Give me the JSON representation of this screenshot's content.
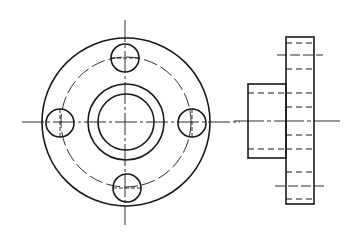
{
  "drawing": {
    "title": "Flange – front view and side view",
    "stroke_color": "#1a1a1a",
    "background_color": "#ffffff",
    "front_view": {
      "center": [
        125,
        122
      ],
      "outer_circle_radius": 84,
      "bolt_circle_radius": 63,
      "hub_outer_radius": 38,
      "bore_radius": 28,
      "bolt_hole_radius": 14,
      "bolt_holes": [
        {
          "name": "top",
          "cx": 125,
          "cy": 58
        },
        {
          "name": "right",
          "cx": 189,
          "cy": 122
        },
        {
          "name": "bottom",
          "cx": 127,
          "cy": 187
        },
        {
          "name": "left",
          "cx": 60,
          "cy": 122
        }
      ]
    },
    "side_view": {
      "flange_rect": {
        "x": 286,
        "y": 37,
        "w": 28,
        "h": 167
      },
      "hub_rect": {
        "x": 248,
        "y": 84,
        "w": 38,
        "h": 74
      },
      "centerline_y": 121,
      "hidden_lines_y": [
        43,
        66,
        93,
        107,
        135,
        149,
        176,
        199
      ],
      "bolt_centerlines_y": [
        55,
        187
      ]
    }
  }
}
